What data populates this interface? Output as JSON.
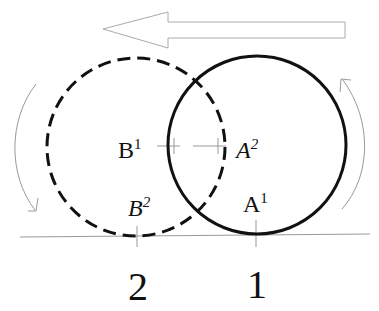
{
  "diagram": {
    "direction_arrow": "left",
    "labels": {
      "b1": {
        "base": "B",
        "sup": "1"
      },
      "a2": {
        "base": "A",
        "sup": "2"
      },
      "b2": {
        "base": "B",
        "sup": "2"
      },
      "a1": {
        "base": "A",
        "sup": "1"
      }
    },
    "positions": [
      "2",
      "1"
    ],
    "colors": {
      "stroke": "#111111",
      "guide": "#999999"
    }
  }
}
